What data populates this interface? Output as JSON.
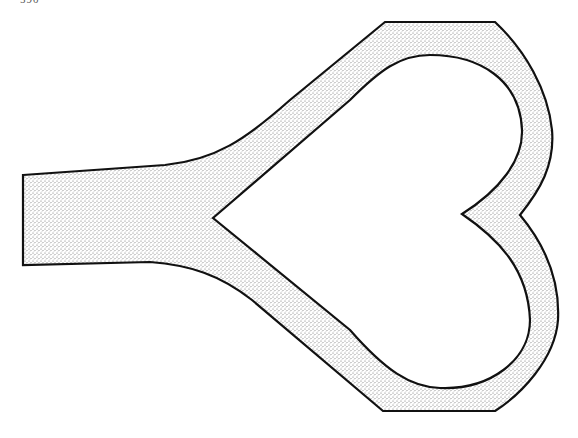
{
  "page": {
    "page_number": "590"
  },
  "figure": {
    "fill_color": "#cfcfcf",
    "stroke_color": "#111111",
    "background": "#ffffff"
  }
}
